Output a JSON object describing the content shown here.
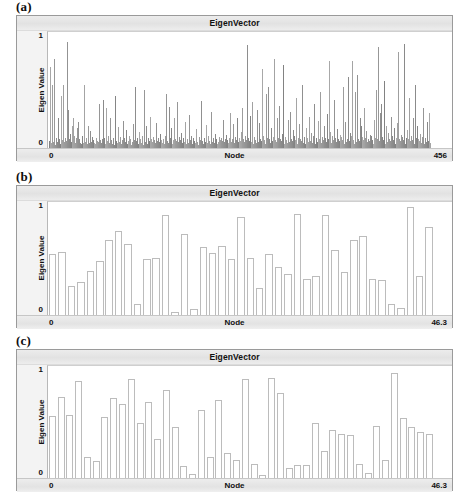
{
  "figure": {
    "panels": [
      {
        "tag": "(a)",
        "title": "EigenVector",
        "ylabel": "Eigen Value",
        "xlabel": "Node",
        "y_ticks": [
          "1",
          "0"
        ],
        "x_min": "0",
        "x_max": "456"
      },
      {
        "tag": "(b)",
        "title": "EigenVector",
        "ylabel": "Eigen Value",
        "xlabel": "Node",
        "y_ticks": [
          "1",
          "0"
        ],
        "x_min": "0",
        "x_max": "46.3"
      },
      {
        "tag": "(c)",
        "title": "EigenVector",
        "ylabel": "Eigen Value",
        "xlabel": "Node",
        "y_ticks": [
          "1",
          "0"
        ],
        "x_min": "0",
        "x_max": "46.3"
      }
    ]
  },
  "colors": {
    "bar_fill": "#8f8f8f",
    "bar_outline": "#bcbcbc",
    "frame": "#9a9a9a",
    "title_bar": "#e6e6e6",
    "plot_bg": "#ffffff",
    "text": "#111111"
  },
  "chart_data": [
    {
      "type": "bar",
      "title": "EigenVector",
      "panel": "(a)",
      "xlabel": "Node",
      "ylabel": "Eigen Value",
      "xlim": [
        0,
        456
      ],
      "ylim": [
        0,
        1.15
      ],
      "grid": false,
      "legend": null,
      "note": "Dense spiky eigenvector over 456 nodes; most entries near 0 with scattered tall spikes reaching ~1.",
      "values": [
        0.07,
        0.8,
        0.05,
        0.04,
        0.62,
        0.06,
        0.88,
        0.03,
        0.1,
        0.05,
        0.06,
        0.3,
        0.09,
        0.04,
        0.52,
        0.05,
        0.08,
        0.62,
        0.06,
        0.1,
        0.07,
        1.05,
        0.05,
        0.38,
        0.09,
        0.14,
        0.06,
        0.04,
        0.22,
        0.3,
        0.12,
        0.05,
        0.1,
        0.2,
        0.07,
        0.26,
        0.09,
        0.05,
        0.04,
        0.12,
        0.07,
        0.05,
        0.62,
        0.06,
        0.1,
        0.04,
        0.22,
        0.08,
        0.05,
        0.17,
        0.06,
        0.11,
        0.03,
        0.08,
        0.05,
        0.04,
        0.1,
        0.07,
        0.06,
        0.03,
        0.44,
        0.08,
        0.05,
        0.09,
        0.48,
        0.06,
        0.1,
        0.04,
        0.4,
        0.07,
        0.06,
        0.12,
        0.05,
        0.3,
        0.08,
        0.04,
        0.1,
        0.06,
        0.03,
        0.52,
        0.07,
        0.05,
        0.09,
        0.21,
        0.06,
        0.11,
        0.04,
        0.08,
        0.27,
        0.05,
        0.1,
        0.06,
        0.18,
        0.04,
        0.07,
        0.12,
        0.05,
        0.09,
        0.03,
        0.06,
        0.24,
        0.08,
        0.05,
        0.6,
        0.07,
        0.1,
        0.04,
        0.16,
        0.06,
        0.09,
        0.05,
        0.12,
        0.03,
        0.58,
        0.08,
        0.06,
        0.22,
        0.04,
        0.1,
        0.07,
        0.05,
        0.31,
        0.09,
        0.06,
        0.11,
        0.04,
        0.08,
        0.05,
        0.25,
        0.07,
        0.1,
        0.06,
        0.03,
        0.14,
        0.08,
        0.05,
        0.09,
        0.04,
        0.12,
        0.06,
        0.54,
        0.07,
        0.05,
        0.41,
        0.1,
        0.06,
        0.2,
        0.04,
        0.08,
        0.3,
        0.05,
        0.09,
        0.07,
        0.46,
        0.06,
        0.11,
        0.04,
        0.08,
        0.15,
        0.05,
        0.1,
        0.06,
        0.26,
        0.07,
        0.04,
        0.09,
        0.05,
        0.33,
        0.08,
        0.06,
        0.12,
        0.04,
        0.1,
        0.07,
        0.05,
        0.19,
        0.09,
        0.06,
        0.03,
        0.11,
        0.08,
        0.05,
        0.47,
        0.07,
        0.04,
        0.1,
        0.06,
        0.23,
        0.09,
        0.05,
        0.12,
        0.07,
        0.04,
        0.36,
        0.08,
        0.06,
        0.1,
        0.05,
        0.14,
        0.07,
        0.09,
        0.04,
        0.06,
        0.11,
        0.08,
        0.05,
        0.1,
        0.07,
        0.28,
        0.06,
        0.09,
        0.04,
        0.13,
        0.08,
        0.05,
        0.1,
        0.35,
        0.06,
        0.09,
        0.07,
        0.24,
        0.05,
        0.11,
        0.08,
        0.04,
        0.3,
        0.06,
        0.1,
        0.07,
        0.16,
        0.05,
        0.4,
        0.09,
        0.06,
        0.12,
        0.08,
        1.02,
        0.05,
        0.1,
        0.07,
        0.32,
        0.06,
        0.09,
        0.46,
        0.04,
        0.11,
        0.08,
        0.05,
        0.38,
        0.1,
        0.06,
        0.25,
        0.09,
        0.07,
        0.78,
        0.05,
        0.12,
        0.08,
        0.04,
        0.54,
        0.1,
        0.06,
        0.6,
        0.09,
        0.05,
        0.2,
        0.07,
        0.11,
        0.04,
        0.88,
        0.08,
        0.06,
        0.3,
        0.1,
        0.05,
        0.42,
        0.09,
        0.07,
        0.14,
        0.06,
        0.82,
        0.04,
        0.11,
        0.08,
        0.05,
        0.28,
        0.1,
        0.06,
        0.36,
        0.09,
        0.07,
        0.18,
        0.05,
        0.12,
        0.08,
        0.5,
        0.04,
        0.1,
        0.06,
        0.24,
        0.09,
        0.07,
        0.62,
        0.05,
        0.11,
        0.08,
        0.04,
        0.2,
        0.1,
        0.06,
        0.31,
        0.09,
        0.07,
        0.15,
        0.05,
        0.12,
        0.44,
        0.08,
        0.04,
        0.1,
        0.06,
        0.27,
        0.09,
        0.07,
        0.56,
        0.05,
        0.11,
        0.08,
        0.04,
        0.22,
        0.1,
        0.06,
        0.34,
        0.09,
        0.86,
        0.07,
        0.16,
        0.05,
        0.12,
        0.08,
        0.04,
        0.48,
        0.1,
        0.06,
        0.19,
        0.09,
        0.07,
        0.13,
        0.05,
        0.11,
        0.08,
        0.6,
        0.04,
        0.1,
        0.26,
        0.06,
        0.09,
        0.7,
        0.07,
        0.15,
        0.05,
        0.12,
        0.86,
        0.08,
        0.04,
        0.56,
        0.1,
        0.06,
        0.72,
        0.09,
        0.07,
        0.3,
        0.05,
        0.22,
        0.11,
        0.08,
        0.4,
        0.04,
        0.1,
        0.17,
        0.06,
        0.09,
        0.07,
        0.13,
        0.05,
        0.12,
        0.08,
        0.04,
        0.28,
        0.1,
        0.06,
        0.58,
        0.09,
        1.0,
        0.07,
        0.35,
        0.05,
        0.44,
        0.11,
        0.08,
        0.66,
        0.04,
        0.22,
        0.1,
        0.06,
        0.15,
        0.09,
        0.07,
        0.31,
        0.05,
        0.12,
        0.08,
        0.2,
        0.04,
        0.1,
        0.06,
        0.25,
        0.95,
        0.09,
        0.07,
        0.13,
        0.05,
        0.11,
        0.08,
        1.03,
        0.04,
        0.1,
        0.18,
        0.06,
        0.09,
        0.5,
        0.07,
        0.12,
        0.05,
        0.08,
        0.3,
        0.04,
        0.62,
        0.1,
        0.06,
        0.22,
        0.09,
        0.07,
        0.14,
        0.05,
        0.11,
        0.08,
        0.4,
        0.04,
        0.1,
        0.06,
        0.26,
        0.09,
        0.07,
        0.35,
        0.05
      ]
    },
    {
      "type": "bar",
      "title": "EigenVector",
      "panel": "(b)",
      "xlabel": "Node",
      "ylabel": "Eigen Value",
      "xlim": [
        0,
        46.3
      ],
      "ylim": [
        0,
        1.15
      ],
      "grid": false,
      "legend": null,
      "note": "Sparse eigenvector with ~40 wide outlined bars of varying height.",
      "values": [
        0.62,
        0.64,
        0.3,
        0.34,
        0.45,
        0.55,
        0.76,
        0.85,
        0.72,
        0.11,
        0.57,
        0.58,
        1.02,
        0.03,
        0.82,
        0.06,
        0.69,
        0.63,
        0.7,
        0.57,
        1.0,
        0.58,
        0.28,
        0.62,
        0.49,
        0.42,
        1.03,
        0.37,
        0.4,
        1.02,
        0.66,
        0.44,
        0.76,
        0.8,
        0.37,
        0.36,
        0.11,
        0.07,
        1.1,
        0.4,
        0.9
      ]
    },
    {
      "type": "bar",
      "title": "EigenVector",
      "panel": "(c)",
      "xlabel": "Node",
      "ylabel": "Eigen Value",
      "xlim": [
        0,
        46.3
      ],
      "ylim": [
        0,
        1.15
      ],
      "grid": false,
      "legend": null,
      "note": "Sparse eigenvector with ~40 wide outlined bars; similar support to panel (b) with different amplitudes.",
      "values": [
        0.64,
        0.83,
        0.65,
        1.0,
        0.22,
        0.17,
        0.63,
        0.82,
        0.76,
        1.02,
        0.56,
        0.78,
        0.4,
        0.9,
        0.52,
        0.12,
        0.04,
        0.7,
        0.22,
        0.8,
        0.26,
        0.19,
        1.02,
        0.14,
        0.03,
        1.03,
        0.87,
        0.1,
        0.13,
        0.13,
        0.57,
        0.28,
        0.49,
        0.45,
        0.44,
        0.14,
        0.05,
        0.53,
        0.18,
        1.08,
        0.62,
        0.52,
        0.47,
        0.45
      ]
    }
  ]
}
